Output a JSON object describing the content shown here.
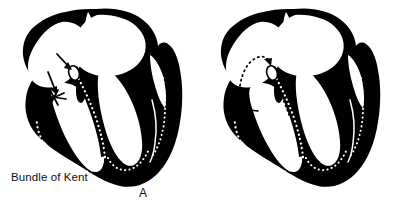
{
  "figure": {
    "background_color": "#ffffff",
    "ink_color": "#000000",
    "width": 397,
    "height": 212
  },
  "labels": {
    "bundle_of_kent": "Bundle of Kent",
    "panel_a_letter": "A",
    "panel_b_letter": "B"
  },
  "panels": [
    {
      "id": "A",
      "letter": "A",
      "description": "Heart cross-section with antegrade conduction down the accessory Bundle of Kent and the AV node",
      "annotations": [
        {
          "name": "av-node-arrow",
          "points_to": "atrioventricular-node"
        },
        {
          "name": "kent-bundle-arrow",
          "points_to": "bundle-of-kent"
        }
      ]
    },
    {
      "id": "B",
      "letter": "B",
      "description": "Heart cross-section with a reentrant circuit looping retrograde through the accessory pathway into the left atrium",
      "annotations": [
        {
          "name": "reentry-loop-arrow",
          "points_to": "reentrant-circuit"
        },
        {
          "name": "retrograde-arrow",
          "points_to": "bundle-of-kent"
        }
      ]
    }
  ],
  "anatomy": [
    {
      "name": "right-atrium",
      "fill": "white",
      "outline": "black"
    },
    {
      "name": "left-atrium",
      "fill": "white",
      "outline": "black"
    },
    {
      "name": "right-ventricle",
      "fill": "white",
      "outline": "black"
    },
    {
      "name": "left-ventricle",
      "fill": "white",
      "outline": "black"
    },
    {
      "name": "myocardium",
      "fill": "black"
    },
    {
      "name": "interventricular-septum",
      "fill": "black"
    },
    {
      "name": "atrioventricular-node",
      "fill": "white"
    },
    {
      "name": "bundle-of-his",
      "style": "dotted-white"
    },
    {
      "name": "purkinje-fibers",
      "style": "dotted-white"
    },
    {
      "name": "bundle-of-kent",
      "style": "accessory-pathway"
    }
  ]
}
